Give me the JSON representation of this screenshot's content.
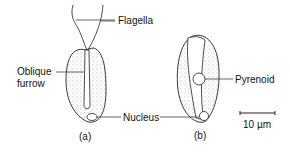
{
  "labels": {
    "flagella": "Flagella",
    "oblique_furrow_line1": "Oblique",
    "oblique_furrow_line2": "furrow",
    "nucleus": "Nucleus",
    "pyrenoid": "Pyrenoid"
  },
  "captions": {
    "a": "(a)",
    "b": "(b)"
  },
  "scale_bar": {
    "label": "10 µm"
  }
}
